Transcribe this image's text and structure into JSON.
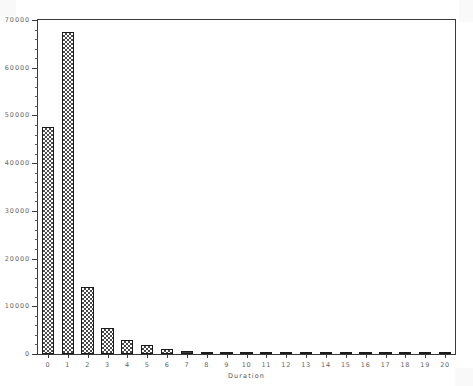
{
  "chart_data": {
    "type": "bar",
    "title": "",
    "subtitle": "",
    "xlabel": "Duration",
    "ylabel": "",
    "categories": [
      "0",
      "1",
      "2",
      "3",
      "4",
      "5",
      "6",
      "7",
      "8",
      "9",
      "10",
      "11",
      "12",
      "13",
      "14",
      "15",
      "16",
      "17",
      "18",
      "19",
      "20"
    ],
    "values": [
      47500,
      67500,
      14000,
      5500,
      3000,
      1800,
      1100,
      700,
      500,
      400,
      300,
      200,
      150,
      120,
      100,
      90,
      80,
      70,
      60,
      50,
      400
    ],
    "xlim": [
      -0.5,
      20.5
    ],
    "ylim": [
      0,
      70000
    ],
    "ytick_labels": [
      "0",
      "10000",
      "20000",
      "30000",
      "40000",
      "50000",
      "60000",
      "70000"
    ],
    "ytick_values": [
      0,
      10000,
      20000,
      30000,
      40000,
      50000,
      60000,
      70000
    ],
    "ytick_minor_step": 2000,
    "xtick_labels": [
      "0",
      "1",
      "2",
      "3",
      "4",
      "5",
      "6",
      "7",
      "8",
      "9",
      "10",
      "11",
      "12",
      "13",
      "14",
      "15",
      "16",
      "17",
      "18",
      "19",
      "20"
    ],
    "grid": false,
    "legend": null,
    "bar_fill": "checkerboard-halftone",
    "bar_edge_color": "#1a1a1a",
    "axis_color": "#3a3a3a",
    "label_color": "#666666",
    "background_color": "#ffffff",
    "annotations": []
  },
  "axis": {
    "x_title": "Duration"
  }
}
